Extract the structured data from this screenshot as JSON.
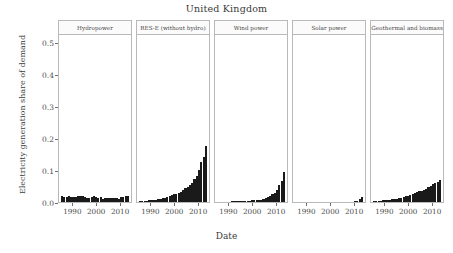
{
  "chart_data": {
    "type": "bar",
    "title": "United Kingdom",
    "xlabel": "Date",
    "ylabel": "Electricity generation share of demand",
    "ylim": [
      0.0,
      0.53
    ],
    "yticks": [
      0.0,
      0.1,
      0.2,
      0.3,
      0.4,
      0.5
    ],
    "ytick_labels": [
      "0.0",
      "0.1",
      "0.2",
      "0.3",
      "0.4",
      "0.5"
    ],
    "xlim": [
      1984,
      2015
    ],
    "xticks": [
      1990,
      2000,
      2010
    ],
    "xtick_labels": [
      "1990",
      "2000",
      "2010"
    ],
    "grid": false,
    "legend": "none",
    "layout": "facet-row, 5 panels",
    "bar_color": "#1a1a1a",
    "x": [
      1985,
      1986,
      1987,
      1988,
      1989,
      1990,
      1991,
      1992,
      1993,
      1994,
      1995,
      1996,
      1997,
      1998,
      1999,
      2000,
      2001,
      2002,
      2003,
      2004,
      2005,
      2006,
      2007,
      2008,
      2009,
      2010,
      2011,
      2012,
      2013,
      2014
    ],
    "panels": [
      {
        "name": "Hydropower",
        "values": [
          0.018,
          0.017,
          0.016,
          0.018,
          0.015,
          0.016,
          0.017,
          0.019,
          0.018,
          0.02,
          0.016,
          0.012,
          0.014,
          0.017,
          0.018,
          0.016,
          0.013,
          0.015,
          0.011,
          0.013,
          0.014,
          0.012,
          0.014,
          0.014,
          0.013,
          0.01,
          0.016,
          0.016,
          0.018,
          0.018
        ],
        "peak": 0.02
      },
      {
        "name": "RES-E (without hydro)",
        "values": [
          0.003,
          0.003,
          0.004,
          0.004,
          0.005,
          0.005,
          0.006,
          0.007,
          0.009,
          0.011,
          0.013,
          0.014,
          0.017,
          0.019,
          0.021,
          0.024,
          0.026,
          0.029,
          0.033,
          0.038,
          0.044,
          0.048,
          0.053,
          0.061,
          0.073,
          0.082,
          0.102,
          0.126,
          0.143,
          0.178
        ],
        "peak": 0.178
      },
      {
        "name": "Wind power",
        "values": [
          0.0,
          0.0,
          0.0,
          0.0,
          0.0,
          0.0,
          0.001,
          0.001,
          0.002,
          0.003,
          0.003,
          0.003,
          0.004,
          0.004,
          0.004,
          0.005,
          0.005,
          0.005,
          0.006,
          0.007,
          0.008,
          0.012,
          0.015,
          0.018,
          0.024,
          0.028,
          0.039,
          0.054,
          0.067,
          0.095
        ],
        "peak": 0.095
      },
      {
        "name": "Solar power",
        "values": [
          0.0,
          0.0,
          0.0,
          0.0,
          0.0,
          0.0,
          0.0,
          0.0,
          0.0,
          0.0,
          0.0,
          0.0,
          0.0,
          0.0,
          0.0,
          0.0,
          0.0,
          0.0,
          0.0,
          0.0,
          0.0,
          0.0,
          0.0,
          0.0,
          0.0,
          0.0,
          0.001,
          0.004,
          0.008,
          0.017
        ],
        "peak": 0.017
      },
      {
        "name": "Geothermal and biomass",
        "values": [
          0.003,
          0.003,
          0.004,
          0.004,
          0.005,
          0.005,
          0.006,
          0.007,
          0.008,
          0.009,
          0.011,
          0.012,
          0.014,
          0.016,
          0.018,
          0.02,
          0.022,
          0.025,
          0.028,
          0.031,
          0.035,
          0.036,
          0.038,
          0.042,
          0.047,
          0.052,
          0.057,
          0.06,
          0.062,
          0.07
        ],
        "peak": 0.07
      }
    ]
  }
}
